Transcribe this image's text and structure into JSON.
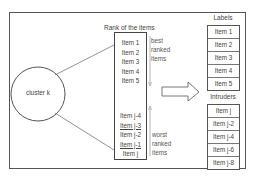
{
  "cluster": {
    "label": "cluster k"
  },
  "rank": {
    "title": "Rank of the items",
    "top_items": [
      "Item 1",
      "Item 2",
      "Item 3",
      "Item 4",
      "Item 5"
    ],
    "bottom_items": [
      {
        "label": "Item j-4",
        "underline": false
      },
      {
        "label": "Item j-3",
        "underline": true
      },
      {
        "label": "Item j-2",
        "underline": false
      },
      {
        "label": "Item j-1",
        "underline": true
      },
      {
        "label": "Item j",
        "underline": false
      }
    ],
    "best_note": [
      "best",
      "ranked",
      "items"
    ],
    "worst_note": [
      "worst",
      "ranked",
      "items"
    ]
  },
  "labels": {
    "title": "Labels",
    "items": [
      "Item 1",
      "Item 2",
      "Item 3",
      "Item 4",
      "Item 5"
    ]
  },
  "intruders": {
    "title": "Intruders",
    "items": [
      "Item j",
      "Item j-2",
      "Item j-4",
      "Item j-6",
      "Item j-8"
    ]
  },
  "colors": {
    "stroke": "#555555",
    "text": "#444444",
    "background": "#ffffff"
  }
}
